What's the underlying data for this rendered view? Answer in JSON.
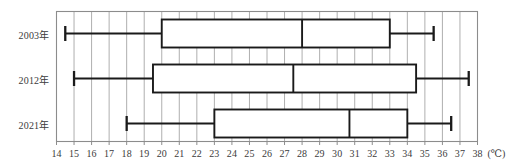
{
  "chart_data": {
    "type": "box",
    "title": "",
    "xlabel": "(℃)",
    "ylabel": "",
    "xlim": [
      14,
      38
    ],
    "xtick_step": 1,
    "grid": true,
    "grid_orientation": "vertical",
    "legend": "none",
    "xticks": [
      "14",
      "15",
      "16",
      "17",
      "18",
      "19",
      "20",
      "21",
      "22",
      "23",
      "24",
      "25",
      "26",
      "27",
      "28",
      "29",
      "30",
      "31",
      "32",
      "33",
      "34",
      "35",
      "36",
      "37",
      "38"
    ],
    "categories": [
      "2003年",
      "2012年",
      "2021年"
    ],
    "series": [
      {
        "name": "2003年",
        "min": 14.5,
        "q1": 20,
        "median": 28,
        "q3": 33,
        "max": 35.5
      },
      {
        "name": "2012年",
        "min": 15,
        "q1": 19.5,
        "median": 27.5,
        "q3": 34.5,
        "max": 37.5
      },
      {
        "name": "2021年",
        "min": 18,
        "q1": 23,
        "median": 30.7,
        "q3": 34,
        "max": 36.5
      }
    ],
    "colors": {
      "frame": "#8c8c8c",
      "grid": "#9a9a9a",
      "box": "#1a1a1a",
      "text": "#3b3b3b",
      "background": "#ffffff"
    }
  }
}
